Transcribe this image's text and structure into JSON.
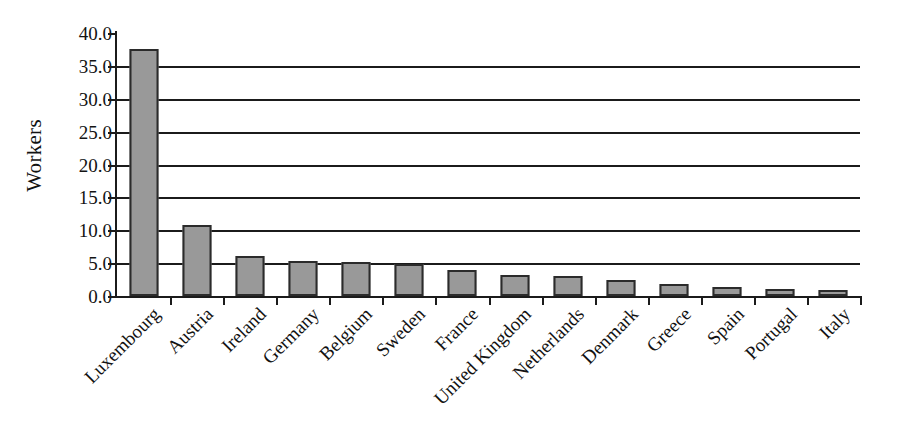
{
  "chart_data": {
    "type": "bar",
    "title": "",
    "xlabel": "",
    "ylabel": "Workers",
    "ylim": [
      0,
      40
    ],
    "ytick_step": 5,
    "grid": true,
    "legend": false,
    "orientation": "vertical",
    "bar_color": "#999999",
    "bar_border_color": "#2b2b2b",
    "axis_color": "#1b1b1b",
    "background_color": "#ffffff",
    "ytick_labels": [
      "40.0",
      "35.0",
      "30.0",
      "25.0",
      "20.0",
      "15.0",
      "10.0",
      "5.0",
      "0.0"
    ],
    "ytick_values": [
      40.0,
      35.0,
      30.0,
      25.0,
      20.0,
      15.0,
      10.0,
      5.0,
      0.0
    ],
    "categories": [
      "Luxembourg",
      "Austria",
      "Ireland",
      "Germany",
      "Belgium",
      "Sweden",
      "France",
      "United Kingdom",
      "Netherlands",
      "Denmark",
      "Greece",
      "Spain",
      "Portugal",
      "Italy"
    ],
    "values": [
      37.5,
      10.8,
      6.1,
      5.3,
      5.2,
      4.8,
      4.0,
      3.2,
      3.1,
      2.4,
      1.9,
      1.4,
      1.0,
      0.9
    ]
  }
}
